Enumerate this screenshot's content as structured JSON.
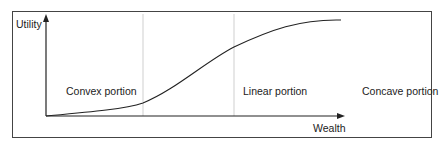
{
  "diagram": {
    "y_axis_label": "Utility",
    "x_axis_label": "Wealth",
    "regions": [
      {
        "label": "Convex portion"
      },
      {
        "label": "Linear portion"
      },
      {
        "label": "Concave portion"
      }
    ],
    "colors": {
      "line": "#222222",
      "divider": "#cccccc",
      "frame": "#444444"
    }
  }
}
